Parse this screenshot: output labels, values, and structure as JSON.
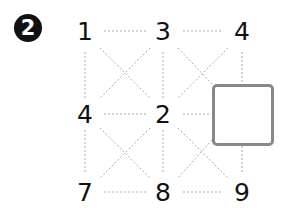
{
  "badge": {
    "label": "2"
  },
  "grid": {
    "rows": [
      [
        "1",
        "3",
        "4"
      ],
      [
        "4",
        "2",
        ""
      ],
      [
        "7",
        "8",
        "9"
      ]
    ],
    "missing_cell": {
      "row": 1,
      "col": 2
    }
  },
  "colors": {
    "line": "#aaaaaa",
    "box_border": "#888888",
    "text": "#111111",
    "badge_bg": "#111111"
  }
}
